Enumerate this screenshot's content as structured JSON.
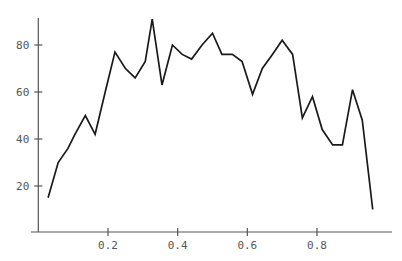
{
  "chart_data": {
    "type": "line",
    "title": "",
    "subtitle": "",
    "xlabel": "",
    "ylabel": "",
    "xlim": [
      0.0,
      1.0
    ],
    "ylim": [
      0,
      95
    ],
    "grid": false,
    "legend": null,
    "legend_position": "none",
    "line_color": "#1a1a1a",
    "axis_color": "#555555",
    "background_color": "#ffffff",
    "xticks": [
      0.2,
      0.4,
      0.6,
      0.8
    ],
    "xtick_labels": [
      "0.2",
      "0.4",
      "0.6",
      "0.8"
    ],
    "yticks": [
      20,
      40,
      60,
      80
    ],
    "ytick_labels": [
      "20",
      "40",
      "60",
      "80"
    ],
    "series": [
      {
        "name": "series-1",
        "x": [
          0.028,
          0.057,
          0.085,
          0.105,
          0.135,
          0.163,
          0.192,
          0.22,
          0.25,
          0.278,
          0.307,
          0.327,
          0.355,
          0.385,
          0.413,
          0.44,
          0.47,
          0.5,
          0.527,
          0.557,
          0.585,
          0.615,
          0.643,
          0.672,
          0.7,
          0.73,
          0.758,
          0.787,
          0.815,
          0.845,
          0.873,
          0.902,
          0.93,
          0.96
        ],
        "values": [
          15,
          30,
          36,
          42,
          50,
          42,
          60,
          77,
          70,
          66,
          73,
          91,
          63,
          80,
          76,
          74,
          80,
          85,
          76,
          76,
          73,
          59,
          70,
          76,
          82,
          76,
          49,
          58,
          44,
          37.5,
          37.5,
          61,
          48,
          10
        ]
      }
    ]
  },
  "axes": {
    "x_axis_name": "x-axis",
    "y_axis_name": "y-axis"
  }
}
